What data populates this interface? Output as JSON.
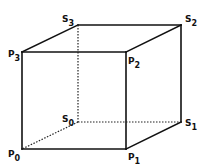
{
  "diagram": {
    "type": "cube-wireframe",
    "vertices": [
      {
        "id": "P0",
        "letter": "P",
        "index": "0"
      },
      {
        "id": "P1",
        "letter": "P",
        "index": "1"
      },
      {
        "id": "P2",
        "letter": "P",
        "index": "2"
      },
      {
        "id": "P3",
        "letter": "P",
        "index": "3"
      },
      {
        "id": "S0",
        "letter": "S",
        "index": "0"
      },
      {
        "id": "S1",
        "letter": "S",
        "index": "1"
      },
      {
        "id": "S2",
        "letter": "S",
        "index": "2"
      },
      {
        "id": "S3",
        "letter": "S",
        "index": "3"
      }
    ],
    "visible_edges": [
      [
        "P0",
        "P1"
      ],
      [
        "P1",
        "P2"
      ],
      [
        "P2",
        "P3"
      ],
      [
        "P3",
        "P0"
      ],
      [
        "P3",
        "S3"
      ],
      [
        "S3",
        "S2"
      ],
      [
        "S2",
        "P2"
      ],
      [
        "S2",
        "S1"
      ],
      [
        "S1",
        "P1"
      ]
    ],
    "hidden_edges": [
      [
        "S3",
        "S0"
      ],
      [
        "S0",
        "S1"
      ],
      [
        "S0",
        "P0"
      ]
    ],
    "colors": {
      "line": "#111111",
      "background": "#ffffff"
    }
  }
}
